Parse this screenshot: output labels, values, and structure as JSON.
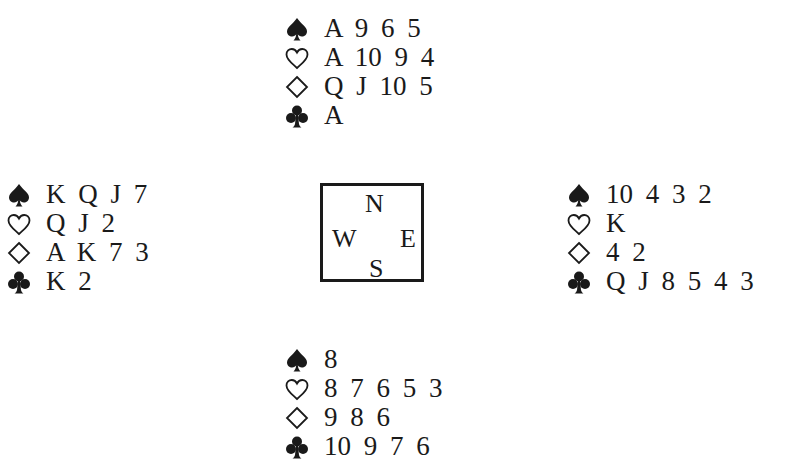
{
  "suit_icons": {
    "spades": "spade-icon",
    "hearts": "heart-icon",
    "diamonds": "diamond-icon",
    "clubs": "club-icon"
  },
  "compass": {
    "north": "N",
    "west": "W",
    "east": "E",
    "south": "S"
  },
  "hands": {
    "north": {
      "spades": "A 9 6 5",
      "hearts": "A 10 9 4",
      "diamonds": "Q J 10 5",
      "clubs": "A"
    },
    "west": {
      "spades": "K Q J 7",
      "hearts": "Q J 2",
      "diamonds": "A K 7 3",
      "clubs": "K 2"
    },
    "east": {
      "spades": "10 4 3 2",
      "hearts": "K",
      "diamonds": "4 2",
      "clubs": "Q J 8 5 4 3"
    },
    "south": {
      "spades": "8",
      "hearts": "8 7 6 5 3",
      "diamonds": "9 8 6",
      "clubs": "10 9 7 6"
    }
  }
}
